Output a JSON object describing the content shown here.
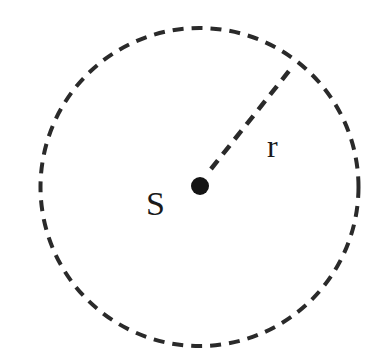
{
  "diagram": {
    "title": "",
    "elements": {
      "circle": {
        "description": "dashed circle boundary",
        "cx": 199.5,
        "cy": 187,
        "r": 159,
        "stroke": "#2a2a2a",
        "stroke_width": 4,
        "dash": "11 8"
      },
      "center_point": {
        "label": "S",
        "cx": 200,
        "cy": 186,
        "r": 9,
        "fill": "#141414"
      },
      "radius_line": {
        "label": "r",
        "x1": 211,
        "y1": 169,
        "x2": 293,
        "y2": 66,
        "stroke": "#2a2a2a",
        "stroke_width": 4.5,
        "dash": "11 8"
      }
    },
    "labels": {
      "source": "S",
      "radius": "r"
    }
  }
}
